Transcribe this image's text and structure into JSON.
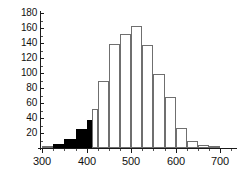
{
  "chart_data": {
    "type": "bar",
    "title": "",
    "subtitle": "",
    "xlabel": "",
    "ylabel": "",
    "grid": false,
    "legend": null,
    "xlim": [
      295,
      740
    ],
    "ylim": [
      0,
      180
    ],
    "bin_width": 25,
    "x_ticks": [
      300,
      400,
      500,
      600,
      700
    ],
    "x_tick_labels": [
      "300",
      "400",
      "500",
      "600",
      "700"
    ],
    "x_minor_tick_step": 25,
    "y_ticks": [
      20,
      40,
      60,
      80,
      100,
      120,
      140,
      160,
      180
    ],
    "y_tick_labels": [
      "20",
      "40",
      "60",
      "80",
      "100",
      "120",
      "140",
      "160",
      "180"
    ],
    "y_minor_tick_step": 10,
    "colors": {
      "filled_bar": "#000000",
      "open_bar": "#ffffff",
      "bar_edge": "#6f6f6f",
      "axis": "#1a1a1a",
      "text": "#111111"
    },
    "bins": [
      {
        "start": 300,
        "end": 325,
        "value": 2,
        "fill": "open"
      },
      {
        "start": 325,
        "end": 350,
        "value": 6,
        "fill": "filled"
      },
      {
        "start": 350,
        "end": 375,
        "value": 12,
        "fill": "filled"
      },
      {
        "start": 375,
        "end": 400,
        "value": 26,
        "fill": "filled"
      },
      {
        "start": 400,
        "end": 412,
        "value": 38,
        "fill": "filled"
      },
      {
        "start": 412,
        "end": 425,
        "value": 52,
        "fill": "open"
      },
      {
        "start": 425,
        "end": 450,
        "value": 90,
        "fill": "open"
      },
      {
        "start": 450,
        "end": 475,
        "value": 139,
        "fill": "open"
      },
      {
        "start": 475,
        "end": 500,
        "value": 152,
        "fill": "open"
      },
      {
        "start": 500,
        "end": 525,
        "value": 163,
        "fill": "open"
      },
      {
        "start": 525,
        "end": 550,
        "value": 137,
        "fill": "open"
      },
      {
        "start": 550,
        "end": 575,
        "value": 99,
        "fill": "open"
      },
      {
        "start": 575,
        "end": 600,
        "value": 68,
        "fill": "open"
      },
      {
        "start": 600,
        "end": 625,
        "value": 27,
        "fill": "open"
      },
      {
        "start": 625,
        "end": 650,
        "value": 9,
        "fill": "open"
      },
      {
        "start": 650,
        "end": 675,
        "value": 4,
        "fill": "open"
      },
      {
        "start": 675,
        "end": 700,
        "value": 1,
        "fill": "open"
      }
    ],
    "categories": [
      "300-325",
      "325-350",
      "350-375",
      "375-400",
      "400-412",
      "412-425",
      "425-450",
      "450-475",
      "475-500",
      "500-525",
      "525-550",
      "550-575",
      "575-600",
      "600-625",
      "625-650",
      "650-675",
      "675-700"
    ],
    "values": [
      2,
      6,
      12,
      26,
      38,
      52,
      90,
      139,
      152,
      163,
      137,
      99,
      68,
      27,
      9,
      4,
      1
    ]
  }
}
